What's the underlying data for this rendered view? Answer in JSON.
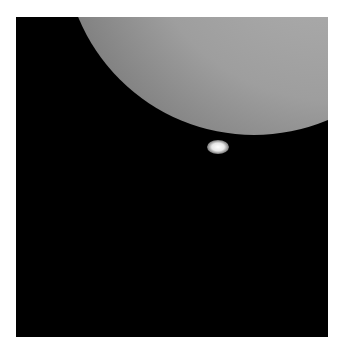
{
  "image": {
    "subject": "bright limb of a large illuminated sphere against black background with a small bright spot at its lower edge",
    "colors": {
      "background": "#000000",
      "border": "#ffffff",
      "disk": "#a8a8a8",
      "spot": "#ffffff"
    }
  }
}
